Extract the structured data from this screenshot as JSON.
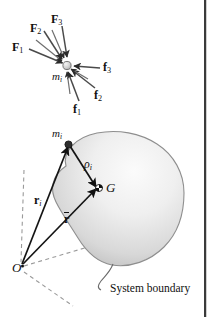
{
  "figure": {
    "background_color": "#ffffff",
    "ink_color": "#1a1a1a",
    "blob_fill_light": "#f2f2f2",
    "blob_fill_dark": "#b9b9b9",
    "dash_color": "#9a9a9a"
  },
  "upper_diagram": {
    "name": "free-body-diagram-of-particle",
    "particle_label": "m",
    "particle_subscript": "i",
    "external_forces": [
      {
        "label": "F",
        "subscript": "1",
        "x": 13,
        "y": 42
      },
      {
        "label": "F",
        "subscript": "2",
        "x": 31,
        "y": 23
      },
      {
        "label": "F",
        "subscript": "3",
        "x": 52,
        "y": 15
      }
    ],
    "internal_forces": [
      {
        "label": "f",
        "subscript": "1",
        "x": 73,
        "y": 103
      },
      {
        "label": "f",
        "subscript": "2",
        "x": 95,
        "y": 90
      },
      {
        "label": "f",
        "subscript": "3",
        "x": 104,
        "y": 62
      }
    ]
  },
  "lower_diagram": {
    "name": "system-of-particles-body-diagram",
    "particle_label": "m",
    "particle_subscript": "i",
    "center_of_mass_label": "G",
    "origin_label": "O",
    "rho_label": "ρ",
    "rho_subscript": "i",
    "r_i_label": "r",
    "r_i_subscript": "i",
    "r_bar_label": "r",
    "boundary_callout": "System boundary"
  }
}
